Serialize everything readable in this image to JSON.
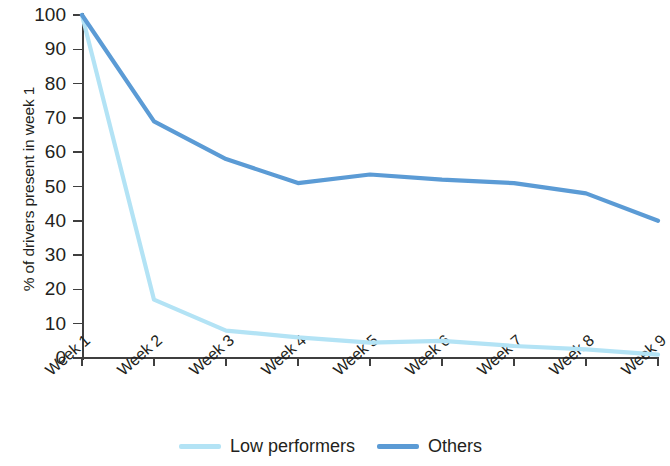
{
  "chart_data": {
    "type": "line",
    "title": "",
    "subtitle": "",
    "xlabel": "",
    "ylabel": "% of drivers present in week 1",
    "categories": [
      "Week 1",
      "Week 2",
      "Week 3",
      "Week 4",
      "Week 5",
      "Week 6",
      "Week 7",
      "Week 8",
      "Week 9"
    ],
    "series": [
      {
        "name": "Low performers",
        "color": "#b3e3f5",
        "values": [
          100,
          17,
          8,
          6,
          4.5,
          5,
          3.5,
          2.5,
          1
        ]
      },
      {
        "name": "Others",
        "color": "#5b9bd5",
        "values": [
          100,
          69,
          58,
          51,
          53.5,
          52,
          51,
          48,
          40
        ]
      }
    ],
    "ylim": [
      0,
      100
    ],
    "ytick_values": [
      0,
      10,
      20,
      30,
      40,
      50,
      60,
      70,
      80,
      90,
      100
    ],
    "ytick_labels": [
      "0",
      "10",
      "20",
      "30",
      "40",
      "50",
      "60",
      "70",
      "80",
      "90",
      "100"
    ],
    "grid": false,
    "legend_position": "bottom"
  },
  "axes": {
    "y_title": "% of drivers present in week 1",
    "y_ticks": [
      "100",
      "90",
      "80",
      "70",
      "60",
      "50",
      "40",
      "30",
      "20",
      "10",
      "0"
    ],
    "x_ticks": [
      "Week 1",
      "Week 2",
      "Week 3",
      "Week 4",
      "Week 5",
      "Week 6",
      "Week 7",
      "Week 8",
      "Week 9"
    ]
  },
  "legend": {
    "items": [
      {
        "label": "Low performers",
        "color": "#b3e3f5"
      },
      {
        "label": "Others",
        "color": "#5b9bd5"
      }
    ]
  },
  "colors": {
    "low_performers": "#b3e3f5",
    "others": "#5b9bd5",
    "axis": "#3f3f3f",
    "text": "#231f20",
    "background": "#ffffff"
  }
}
